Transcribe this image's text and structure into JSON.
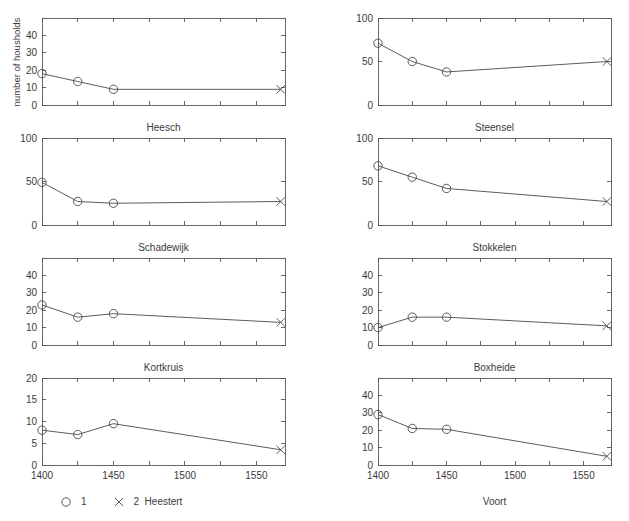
{
  "figure": {
    "ylabel": "number of housholds",
    "background_color": "#ffffff",
    "line_color": "#4a4a4a",
    "axis_color": "#555555",
    "text_color": "#3b3b3b"
  },
  "legend": {
    "entries": [
      {
        "marker": "circle-marker",
        "label": "1"
      },
      {
        "marker": "cross-marker",
        "label": "2"
      }
    ]
  },
  "chart_data": {
    "type": "line",
    "title": "",
    "xlabel": "",
    "ylabel": "number of housholds",
    "grid": false,
    "legend_position": "bottom-left",
    "shared_x": [
      1400,
      1425,
      1450,
      1567
    ],
    "xlim": [
      1400,
      1570
    ],
    "x_tick_interval": 25,
    "x_tick_values": [
      1400,
      1425,
      1450,
      1475,
      1500,
      1525,
      1550
    ],
    "x_tick_labels_shown": [
      "1400",
      "1450",
      "1500",
      "1550"
    ],
    "series_legend": {
      "1": "circle markers (years 1400-1450)",
      "2": "cross marker (year 1567)"
    },
    "panels": [
      {
        "name": "Heesch",
        "row": 0,
        "col": 0,
        "ylim": [
          0,
          50
        ],
        "yticks": [
          0,
          10,
          20,
          30,
          40
        ],
        "ytick_labels": [
          "0",
          "10",
          "20",
          "30",
          "40"
        ],
        "x": [
          1400,
          1425,
          1450,
          1567
        ],
        "values": [
          18,
          13.5,
          9,
          9
        ],
        "marker_types": [
          "circle",
          "circle",
          "circle",
          "cross"
        ]
      },
      {
        "name": "Steensel",
        "row": 0,
        "col": 1,
        "ylim": [
          0,
          100
        ],
        "yticks": [
          0,
          50,
          100
        ],
        "ytick_labels": [
          "0",
          "50",
          "100"
        ],
        "x": [
          1400,
          1425,
          1450,
          1567
        ],
        "values": [
          71,
          50,
          38,
          50
        ],
        "marker_types": [
          "circle",
          "circle",
          "circle",
          "cross"
        ]
      },
      {
        "name": "Schadewijk",
        "row": 1,
        "col": 0,
        "ylim": [
          0,
          100
        ],
        "yticks": [
          0,
          50,
          100
        ],
        "ytick_labels": [
          "0",
          "50",
          "100"
        ],
        "x": [
          1400,
          1425,
          1450,
          1567
        ],
        "values": [
          49,
          27,
          25,
          27
        ],
        "marker_types": [
          "circle",
          "circle",
          "circle",
          "cross"
        ]
      },
      {
        "name": "Stokkelen",
        "row": 1,
        "col": 1,
        "ylim": [
          0,
          100
        ],
        "yticks": [
          0,
          50,
          100
        ],
        "ytick_labels": [
          "0",
          "50",
          "100"
        ],
        "x": [
          1400,
          1425,
          1450,
          1567
        ],
        "values": [
          68,
          55,
          42,
          27
        ],
        "marker_types": [
          "circle",
          "circle",
          "circle",
          "cross"
        ]
      },
      {
        "name": "Kortkruis",
        "row": 2,
        "col": 0,
        "ylim": [
          0,
          50
        ],
        "yticks": [
          0,
          10,
          20,
          30,
          40
        ],
        "ytick_labels": [
          "0",
          "10",
          "20",
          "30",
          "40"
        ],
        "x": [
          1400,
          1425,
          1450,
          1567
        ],
        "values": [
          23,
          16,
          18,
          13
        ],
        "marker_types": [
          "circle",
          "circle",
          "circle",
          "cross"
        ]
      },
      {
        "name": "Boxheide",
        "row": 2,
        "col": 1,
        "ylim": [
          0,
          50
        ],
        "yticks": [
          0,
          10,
          20,
          30,
          40
        ],
        "ytick_labels": [
          "0",
          "10",
          "20",
          "30",
          "40"
        ],
        "x": [
          1400,
          1425,
          1450,
          1567
        ],
        "values": [
          10,
          16,
          16,
          11
        ],
        "marker_types": [
          "circle",
          "circle",
          "circle",
          "cross"
        ]
      },
      {
        "name": "Heestert",
        "row": 3,
        "col": 0,
        "ylim": [
          0,
          20
        ],
        "yticks": [
          0,
          5,
          10,
          15,
          20
        ],
        "ytick_labels": [
          "0",
          "5",
          "10",
          "15",
          "20"
        ],
        "x": [
          1400,
          1425,
          1450,
          1567
        ],
        "values": [
          8,
          7,
          9.5,
          3.5
        ],
        "marker_types": [
          "circle",
          "circle",
          "circle",
          "cross"
        ],
        "show_xticklabels": true
      },
      {
        "name": "Voort",
        "row": 3,
        "col": 1,
        "ylim": [
          0,
          50
        ],
        "yticks": [
          0,
          10,
          20,
          30,
          40
        ],
        "ytick_labels": [
          "0",
          "10",
          "20",
          "30",
          "40"
        ],
        "x": [
          1400,
          1425,
          1450,
          1567
        ],
        "values": [
          29,
          21,
          20.5,
          5
        ],
        "marker_types": [
          "circle",
          "circle",
          "circle",
          "cross"
        ],
        "show_xticklabels": true
      }
    ]
  }
}
